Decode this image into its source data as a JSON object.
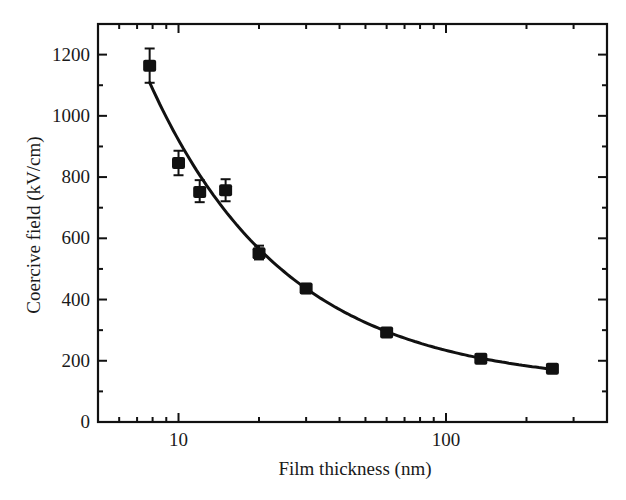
{
  "chart_data": {
    "type": "scatter",
    "title": "",
    "xlabel": "Film thickness (nm)",
    "ylabel": "Coercive field (kV/cm)",
    "xscale": "log",
    "xlim": [
      5,
      400
    ],
    "ylim": [
      0,
      1300
    ],
    "x_ticks": [
      10,
      100
    ],
    "x_tick_labels": [
      "10",
      "100"
    ],
    "y_ticks": [
      0,
      200,
      400,
      600,
      800,
      1000,
      1200
    ],
    "y_tick_labels": [
      "0",
      "200",
      "400",
      "600",
      "800",
      "1000",
      "1200"
    ],
    "y_minor_step": 100,
    "grid": false,
    "legend": null,
    "series": [
      {
        "name": "Measured",
        "marker": "square",
        "color": "#111111",
        "x": [
          7.8,
          10,
          12,
          15,
          20,
          30,
          60,
          135,
          250
        ],
        "y": [
          1164,
          846,
          751,
          757,
          551,
          436,
          292,
          207,
          174
        ],
        "y_err_low": [
          56,
          40,
          33,
          36,
          20,
          15,
          8,
          6,
          5
        ],
        "y_err_high": [
          56,
          40,
          39,
          36,
          25,
          15,
          8,
          6,
          5
        ]
      },
      {
        "name": "Fit",
        "type": "line",
        "color": "#111111",
        "model": "y = A * x^(-n) + C",
        "params": {
          "A": 5632,
          "n": 0.847,
          "C": 120
        },
        "x_range": [
          7.8,
          250
        ]
      }
    ]
  },
  "colors": {
    "axis": "#111111",
    "background": "#ffffff"
  }
}
